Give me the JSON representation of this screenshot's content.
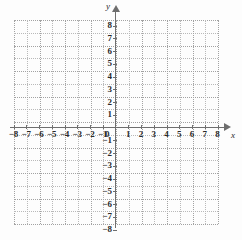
{
  "chart_data": {
    "type": "scatter",
    "title": "",
    "subtitle": "",
    "xlabel": "x",
    "ylabel": "y",
    "xlim": [
      -8,
      8
    ],
    "ylim": [
      -8,
      8
    ],
    "grid": true,
    "grid_step": 1,
    "legend": "none",
    "series": [],
    "x_tick_labels": [
      "-8",
      "-7",
      "-6",
      "-5",
      "-4",
      "-3",
      "-2",
      "-1",
      "1",
      "2",
      "3",
      "4",
      "5",
      "6",
      "7",
      "8"
    ],
    "x_tick_values": [
      -8,
      -7,
      -6,
      -5,
      -4,
      -3,
      -2,
      -1,
      1,
      2,
      3,
      4,
      5,
      6,
      7,
      8
    ],
    "y_tick_labels": [
      "8",
      "7",
      "6",
      "5",
      "4",
      "3",
      "2",
      "1",
      "-1",
      "-2",
      "-3",
      "-4",
      "-5",
      "-6",
      "-7",
      "-8"
    ],
    "y_tick_values": [
      8,
      7,
      6,
      5,
      4,
      3,
      2,
      1,
      -1,
      -2,
      -3,
      -4,
      -5,
      -6,
      -7,
      -8
    ],
    "origin_label": "0",
    "annotations": []
  },
  "axes": {
    "x_name": "x",
    "y_name": "y",
    "origin": "0"
  },
  "colors": {
    "background": "#fdfdfd",
    "axis": "#6e6e6e",
    "grid_minor": "#b9b9b9",
    "grid_major": "#a2a2a2",
    "text": "#2a2a2a"
  }
}
